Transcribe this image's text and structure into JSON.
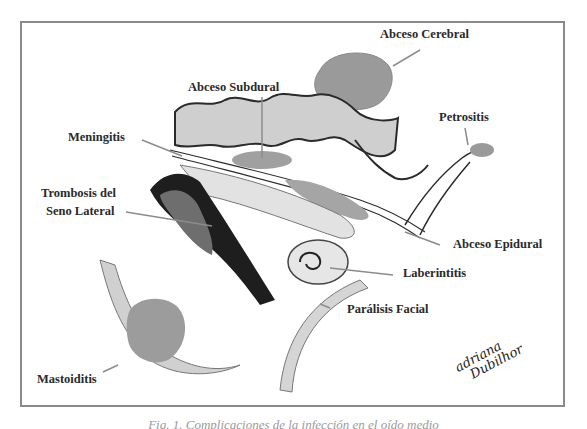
{
  "figure": {
    "labels": {
      "abceso_cerebral": "Abceso Cerebral",
      "abceso_subdural": "Abceso Subdural",
      "petrositis": "Petrositis",
      "meningitis": "Meningitis",
      "trombosis_line1": "Trombosis del",
      "trombosis_line2": "Seno Lateral",
      "abceso_epidural": "Abceso Epidural",
      "laberintitis": "Laberintitis",
      "paralisis_facial": "Parálisis Facial",
      "mastoiditis": "Mastoiditis"
    },
    "signature": {
      "line1": "adriana",
      "line2": "Dubilhor"
    },
    "colors": {
      "frame": "#8a8a8a",
      "tissue_gray": "#9e9e9e",
      "dark_sinus": "#1e1e1e",
      "light_fill": "#d9d9d9",
      "leader_line": "#8c8c8c"
    }
  },
  "caption": "Fig. 1. Complicaciones de la infección en el oído medio"
}
